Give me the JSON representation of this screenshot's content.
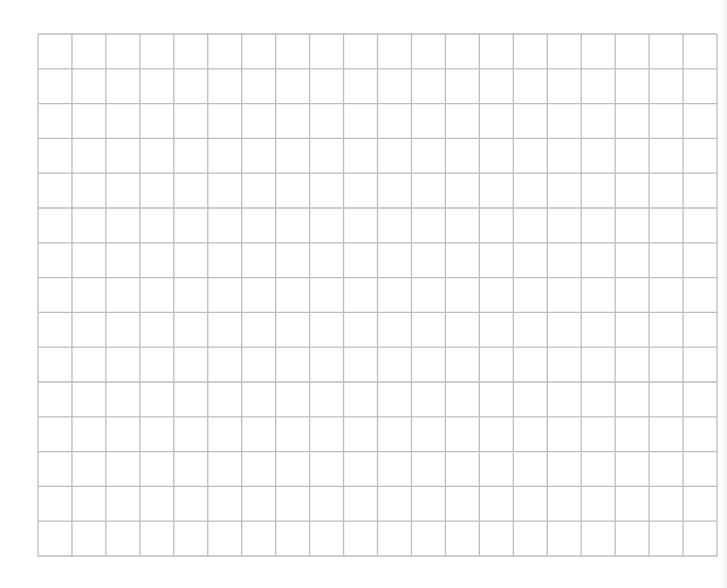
{
  "page": {
    "background": "#ffffff"
  },
  "grid": {
    "left": 38,
    "top": 34,
    "right": 717,
    "bottom": 556,
    "columns": 20,
    "rows": 15,
    "line_color": "#bdbdbd",
    "line_width": 1.3
  }
}
